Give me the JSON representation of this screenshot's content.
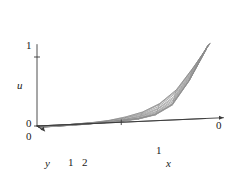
{
  "figure": {
    "kind": "surface-mesh-plot",
    "background_color": "#ffffff",
    "mesh_color": "#8a8a8a",
    "axis_color": "#3a3a3a",
    "text_color": "#1a1a1a"
  },
  "axes": {
    "vertical": {
      "name": "u",
      "label": "u",
      "ticks": [
        {
          "label": "0",
          "value": 0
        },
        {
          "label": "1",
          "value": 1
        }
      ]
    },
    "depth": {
      "name": "y",
      "label": "y",
      "ticks": [
        {
          "label": "0",
          "value": 0
        },
        {
          "label": "1",
          "value": 1
        }
      ]
    },
    "horizontal": {
      "name": "x",
      "label": "x",
      "ticks": [
        {
          "label": "2",
          "value": 2
        },
        {
          "label": "1",
          "value": 1
        },
        {
          "label": "0",
          "value": 0
        }
      ]
    }
  },
  "chart_data": {
    "type": "surface",
    "title": "",
    "xlabel": "x",
    "ylabel": "y",
    "zlabel": "u",
    "xlim": [
      2,
      0
    ],
    "ylim": [
      0,
      1
    ],
    "zlim": [
      0,
      1.15
    ],
    "grid": true,
    "legend": null,
    "x_reversed": true,
    "nx": 11,
    "ny": 11,
    "x": [
      2.0,
      1.8,
      1.6,
      1.4,
      1.2,
      1.0,
      0.8,
      0.6,
      0.4,
      0.2,
      0.0
    ],
    "y": [
      0.0,
      0.1,
      0.2,
      0.3,
      0.4,
      0.5,
      0.6,
      0.7,
      0.8,
      0.9,
      1.0
    ],
    "z_note": "rows indexed by y (front to back), columns by x (2 -> 0)",
    "z": [
      [
        0.0,
        0.0,
        0.0,
        0.01,
        0.01,
        0.02,
        0.04,
        0.09,
        0.22,
        0.55,
        0.98
      ],
      [
        0.0,
        0.0,
        0.0,
        0.01,
        0.01,
        0.02,
        0.04,
        0.09,
        0.22,
        0.56,
        1.0
      ],
      [
        0.0,
        0.0,
        0.01,
        0.01,
        0.02,
        0.03,
        0.05,
        0.1,
        0.24,
        0.58,
        1.02
      ],
      [
        0.0,
        0.0,
        0.01,
        0.01,
        0.02,
        0.03,
        0.06,
        0.12,
        0.26,
        0.6,
        1.04
      ],
      [
        0.0,
        0.01,
        0.01,
        0.02,
        0.03,
        0.04,
        0.07,
        0.14,
        0.29,
        0.63,
        1.06
      ],
      [
        0.01,
        0.01,
        0.01,
        0.02,
        0.03,
        0.05,
        0.09,
        0.16,
        0.32,
        0.66,
        1.08
      ],
      [
        0.01,
        0.01,
        0.02,
        0.03,
        0.04,
        0.06,
        0.1,
        0.19,
        0.35,
        0.69,
        1.09
      ],
      [
        0.01,
        0.02,
        0.02,
        0.03,
        0.05,
        0.07,
        0.12,
        0.21,
        0.38,
        0.72,
        1.1
      ],
      [
        0.02,
        0.02,
        0.03,
        0.04,
        0.06,
        0.09,
        0.14,
        0.24,
        0.42,
        0.75,
        1.11
      ],
      [
        0.02,
        0.03,
        0.04,
        0.05,
        0.07,
        0.1,
        0.16,
        0.27,
        0.45,
        0.77,
        1.12
      ],
      [
        0.03,
        0.04,
        0.05,
        0.06,
        0.08,
        0.12,
        0.18,
        0.29,
        0.48,
        0.79,
        1.13
      ]
    ]
  }
}
